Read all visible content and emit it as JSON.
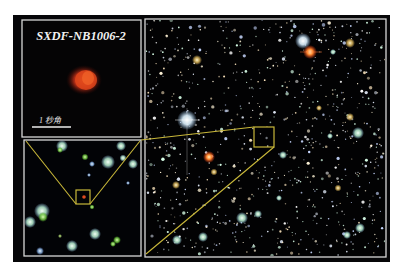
{
  "figure": {
    "background": "#ffffff",
    "frame_color": "#060608",
    "border_color": "#d8d8d8",
    "highlight_color": "#c9b83a"
  },
  "inset_top": {
    "title": "SXDF-NB1006-2",
    "scale_label": "1 秒角",
    "object_color": "#e0421c"
  },
  "inset_bottom": {
    "description": "zoomed field around target"
  },
  "main_field": {
    "description": "deep sky field"
  }
}
